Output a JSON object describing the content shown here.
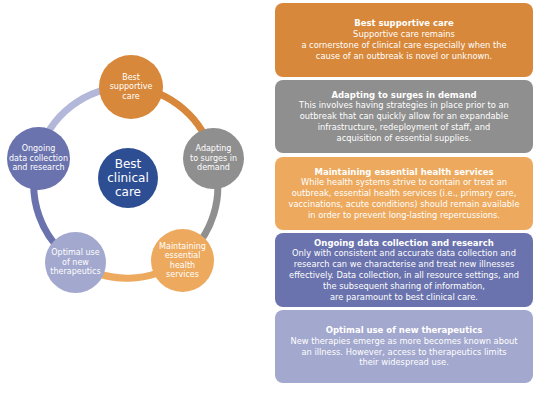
{
  "colors": {
    "orange": "#D8883A",
    "gray": "#8F8F8F",
    "light_orange": "#EDAA5E",
    "purple": "#6A73AD",
    "lavender": "#A3A8CE",
    "navy": "#2E4E94",
    "ring_lavender": "#B3B7D9"
  },
  "diagram": {
    "center": {
      "label": "Best\nclinical\ncare"
    },
    "nodes": [
      {
        "id": "best-supportive-care",
        "label": "Best\nsupportive\ncare"
      },
      {
        "id": "adapting-to-surges",
        "label": "Adapting\nto surges in\ndemand"
      },
      {
        "id": "maintaining-essential-services",
        "label": "Maintaining\nessential\nhealth\nservices"
      },
      {
        "id": "optimal-use-therapeutics",
        "label": "Optimal use\nof new\ntherapeutics"
      },
      {
        "id": "ongoing-data-collection",
        "label": "Ongoing\ndata collection\nand research"
      }
    ]
  },
  "panels": [
    {
      "title": "Best supportive care",
      "body": "Supportive care remains\na cornerstone of clinical care especially when the\ncause of an outbreak is novel or unknown."
    },
    {
      "title": "Adapting to surges in demand",
      "body": "This involves having strategies in place prior to an\noutbreak that can quickly allow for an expandable\ninfrastructure, redeployment of staff, and\nacquisition of essential supplies."
    },
    {
      "title": "Maintaining essential health services",
      "body": "While health systems strive to contain or treat an\noutbreak, essential health services (i.e., primary care,\nvaccinations, acute conditions) should remain available\nin order to prevent long-lasting repercussions."
    },
    {
      "title": "Ongoing data collection and research",
      "body": "Only with consistent and accurate data collection and\nresearch can we characterise and treat new illnesses\neffectively. Data collection, in all resource settings, and\nthe subsequent sharing of information,\nare paramount to best clinical care."
    },
    {
      "title": "Optimal use of new therapeutics",
      "body": "New therapies emerge as more becomes known about\nan illness. However, access to therapeutics limits\ntheir widespread use."
    }
  ]
}
